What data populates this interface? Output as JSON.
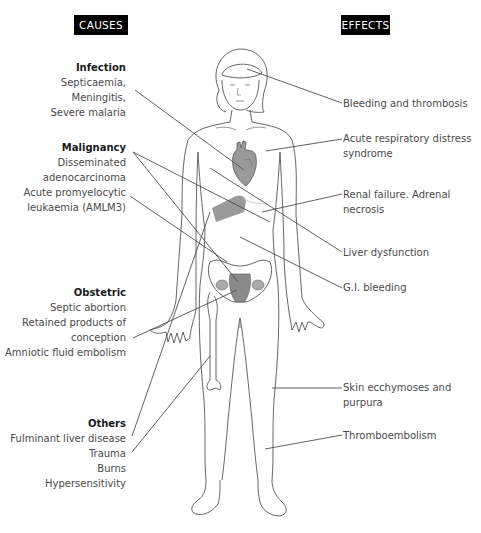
{
  "headers": {
    "causes": "CAUSES",
    "effects": "EFFECTS"
  },
  "causes": [
    {
      "title": "Infection",
      "items": [
        "Septicaemia,",
        "Meningitis,",
        "Severe malaria"
      ]
    },
    {
      "title": "Malignancy",
      "items": [
        "Disseminated",
        "adenocarcinoma",
        "Acute promyelocytic",
        "leukaemia (AMLM3)"
      ]
    },
    {
      "title": "Obstetric",
      "items": [
        "Septic abortion",
        "Retained products of",
        "conception",
        "Amniotic fluid embolism"
      ]
    },
    {
      "title": "Others",
      "items": [
        "Fulminant liver disease",
        "Trauma",
        "Burns",
        "Hypersensitivity"
      ]
    }
  ],
  "effects": [
    {
      "lines": [
        "Bleeding and thrombosis"
      ]
    },
    {
      "lines": [
        "Acute respiratory distress",
        "syndrome"
      ]
    },
    {
      "lines": [
        "Renal failure.  Adrenal",
        "necrosis"
      ]
    },
    {
      "lines": [
        "Liver dysfunction"
      ]
    },
    {
      "lines": [
        "G.I. bleeding"
      ]
    },
    {
      "lines": [
        "Skin ecchymoses and",
        "purpura"
      ]
    },
    {
      "lines": [
        "Thromboembolism"
      ]
    }
  ],
  "colors": {
    "header_bg": "#000000",
    "header_text": "#ffffff",
    "outline": "#555555",
    "organ_fill": "#9a9a9a",
    "leader_line": "#444444"
  }
}
